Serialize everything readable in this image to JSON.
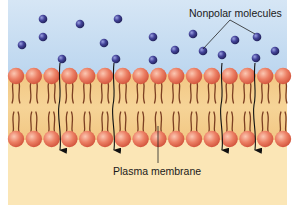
{
  "diagram": {
    "labels": {
      "nonpolar_molecules": "Nonpolar molecules",
      "plasma_membrane": "Plasma membrane"
    },
    "colors": {
      "extracellular_bg": "#c9dff2",
      "membrane_bg": "#f0c98a",
      "cytoplasm_bg": "#fbe8b8",
      "phospholipid_head": "#e8735a",
      "phospholipid_head_highlight": "#f6b59e",
      "lipid_tail": "#7a3b20",
      "molecule": "#3a3a8c",
      "molecule_highlight": "#8b8fd6",
      "arrow": "#111111",
      "label_line": "#222222"
    },
    "molecules": [
      {
        "x": 43,
        "y": 19
      },
      {
        "x": 80,
        "y": 24
      },
      {
        "x": 118,
        "y": 19
      },
      {
        "x": 43,
        "y": 37
      },
      {
        "x": 22,
        "y": 45
      },
      {
        "x": 104,
        "y": 43
      },
      {
        "x": 62,
        "y": 59
      },
      {
        "x": 116,
        "y": 59
      },
      {
        "x": 153,
        "y": 37
      },
      {
        "x": 193,
        "y": 34
      },
      {
        "x": 235,
        "y": 40
      },
      {
        "x": 257,
        "y": 37
      },
      {
        "x": 175,
        "y": 50
      },
      {
        "x": 203,
        "y": 51
      },
      {
        "x": 222,
        "y": 55
      },
      {
        "x": 275,
        "y": 51
      },
      {
        "x": 153,
        "y": 60
      },
      {
        "x": 256,
        "y": 58
      }
    ],
    "crossing_arrows_x": [
      60,
      114,
      222,
      255
    ],
    "phospholipid_count_per_layer": 16
  }
}
